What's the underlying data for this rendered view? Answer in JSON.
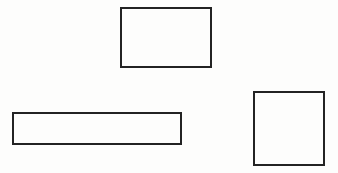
{
  "canvas": {
    "width": 338,
    "height": 173,
    "background": "#fdfdfc"
  },
  "shapes": [
    {
      "id": "rect-top",
      "type": "rectangle",
      "x": 120,
      "y": 7,
      "width": 92,
      "height": 61,
      "stroke": "#232323",
      "stroke_width": 2,
      "fill": "none"
    },
    {
      "id": "rect-bottom-left",
      "type": "rectangle",
      "x": 12,
      "y": 112,
      "width": 170,
      "height": 33,
      "stroke": "#232323",
      "stroke_width": 2,
      "fill": "none"
    },
    {
      "id": "rect-right",
      "type": "rectangle",
      "x": 253,
      "y": 91,
      "width": 72,
      "height": 75,
      "stroke": "#232323",
      "stroke_width": 2,
      "fill": "none"
    }
  ]
}
